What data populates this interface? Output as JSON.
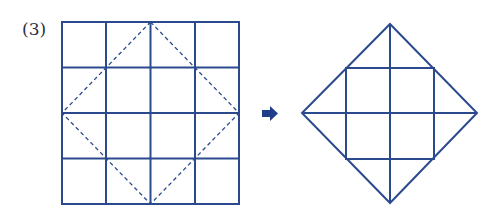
{
  "problem_label": "(3)",
  "colors": {
    "line": "#2b4a8e",
    "arrow": "#1f3f8a",
    "label": "#2a2f45"
  },
  "left_figure": {
    "description": "4x4 square grid with dashed diamond connecting edge midpoints",
    "grid": {
      "x0": 62,
      "y0": 22,
      "x1": 239,
      "y1": 204,
      "rows": 4,
      "cols": 4
    },
    "dashed_diamond": [
      [
        150.5,
        22
      ],
      [
        239,
        113
      ],
      [
        150.5,
        204
      ],
      [
        62,
        113
      ]
    ]
  },
  "arrow": {
    "icon": "right-arrow-icon"
  },
  "right_figure": {
    "description": "Diamond cut out, showing inner grid lines",
    "diamond": [
      [
        390,
        24
      ],
      [
        477,
        113
      ],
      [
        390,
        203
      ],
      [
        302,
        113
      ]
    ],
    "inner_square": {
      "x0": 346,
      "y0": 68,
      "x1": 434,
      "y1": 159
    }
  }
}
